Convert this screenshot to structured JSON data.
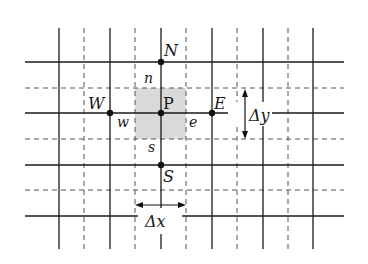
{
  "diagram": {
    "nodes": {
      "center": "P",
      "north": "N",
      "south": "S",
      "west": "W",
      "east": "E"
    },
    "faces": {
      "north": "n",
      "south": "s",
      "west": "w",
      "east": "e"
    },
    "dimensions": {
      "dx": "Δx",
      "dy": "Δy"
    },
    "colors": {
      "line": "#1a1a1a",
      "dashed": "#555555",
      "cell_fill": "#d9d9d9"
    }
  }
}
